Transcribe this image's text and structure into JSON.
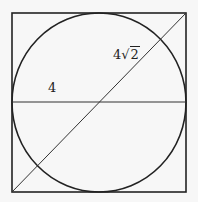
{
  "diagram": {
    "type": "geometry",
    "labels": {
      "radius": "4",
      "diagonal_coefficient": "4",
      "diagonal_sqrt_symbol": "√",
      "diagonal_radicand": "2"
    },
    "colors": {
      "stroke": "#222222",
      "background": "#f7f7f7"
    },
    "shapes": {
      "square": {
        "x": 12,
        "y": 13,
        "width": 174,
        "height": 179
      },
      "circle": {
        "cx": 99,
        "cy": 102,
        "rx": 87,
        "ry": 89
      },
      "horizontal_line": {
        "x1": 12,
        "y1": 102,
        "x2": 186,
        "y2": 102
      },
      "diagonal": {
        "x1": 12,
        "y1": 192,
        "x2": 186,
        "y2": 13
      }
    }
  }
}
